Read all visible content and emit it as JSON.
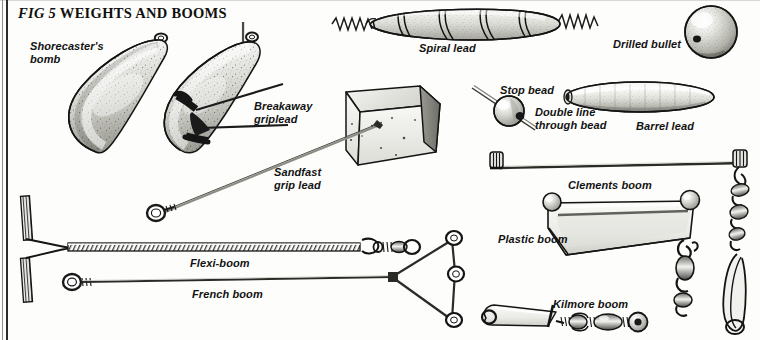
{
  "figure": {
    "title_prefix": "FIG 5",
    "title_main": "WEIGHTS AND BOOMS",
    "kind": "line-and-stipple technical illustration"
  },
  "colors": {
    "page_background": "#fdfdfb",
    "ink": "#121212",
    "rule_dark": "#2b2b2b",
    "rule_light": "#8d8d8d",
    "lead_body_light": "#f2f2ef",
    "lead_body_mid": "#c9c9c4",
    "lead_body_dark": "#8e8e88",
    "stipple": "#3a3a36",
    "wire": "#2a2a28",
    "plastic_fill": "#efefec"
  },
  "labels": [
    {
      "id": "shorecasters-bomb",
      "line1": "Shorecaster's",
      "line2": "bomb",
      "x": 30,
      "y": 40
    },
    {
      "id": "breakaway-griplead",
      "line1": "Breakaway",
      "line2": "griplead",
      "x": 254,
      "y": 100
    },
    {
      "id": "spiral-lead",
      "line1": "Spiral lead",
      "line2": "",
      "x": 419,
      "y": 42
    },
    {
      "id": "drilled-bullet",
      "line1": "Drilled bullet",
      "line2": "",
      "x": 613,
      "y": 38
    },
    {
      "id": "stop-bead",
      "line1": "Stop bead",
      "line2": "",
      "x": 500,
      "y": 84
    },
    {
      "id": "double-line-bead",
      "line1": "Double line",
      "line2": "through bead",
      "x": 535,
      "y": 106
    },
    {
      "id": "barrel-lead",
      "line1": "Barrel lead",
      "line2": "",
      "x": 636,
      "y": 120
    },
    {
      "id": "sandfast-grip-lead",
      "line1": "Sandfast",
      "line2": "grip lead",
      "x": 274,
      "y": 166
    },
    {
      "id": "clements-boom",
      "line1": "Clements boom",
      "line2": "",
      "x": 568,
      "y": 179
    },
    {
      "id": "plastic-boom",
      "line1": "Plastic boom",
      "line2": "",
      "x": 498,
      "y": 233
    },
    {
      "id": "flexi-boom",
      "line1": "Flexi-boom",
      "line2": "",
      "x": 190,
      "y": 257
    },
    {
      "id": "kilmore-boom",
      "line1": "Kilmore boom",
      "line2": "",
      "x": 553,
      "y": 298
    },
    {
      "id": "french-boom",
      "line1": "French boom",
      "line2": "",
      "x": 192,
      "y": 288
    }
  ],
  "items": [
    {
      "id": "shorecasters-bomb",
      "name": "Shorecaster's bomb",
      "type": "lead weight",
      "shape": "teardrop / pear, wire swivel eye at top"
    },
    {
      "id": "breakaway-griplead",
      "name": "Breakaway griplead",
      "type": "lead weight",
      "shape": "teardrop with sprung grip wires and release collar"
    },
    {
      "id": "spiral-lead",
      "name": "Spiral lead",
      "type": "lead weight",
      "shape": "spindle with spiral groove and coiled wire ends"
    },
    {
      "id": "drilled-bullet",
      "name": "Drilled bullet",
      "type": "lead weight",
      "shape": "sphere with through bore"
    },
    {
      "id": "barrel-lead",
      "name": "Barrel lead",
      "type": "lead weight",
      "shape": "elongated barrel with through bore"
    },
    {
      "id": "sandfast-grip-lead",
      "name": "Sandfast grip lead",
      "type": "lead weight",
      "shape": "triangular wedge block with wire loop trace"
    },
    {
      "id": "stop-bead",
      "name": "Stop bead",
      "type": "component",
      "shape": "round bead on line"
    },
    {
      "id": "double-line-bead",
      "name": "Double line through bead",
      "type": "rig detail",
      "shape": "two line strands passing through bead"
    },
    {
      "id": "clements-boom",
      "name": "Clements boom",
      "type": "boom",
      "shape": "straight wire boom, rolling sleeve each end"
    },
    {
      "id": "plastic-boom",
      "name": "Plastic boom",
      "type": "boom",
      "shape": "moulded triangular plastic boom with end beads"
    },
    {
      "id": "flexi-boom",
      "name": "Flexi-boom",
      "type": "boom",
      "shape": "coiled spring body, swivel and bead, wishbone tail"
    },
    {
      "id": "french-boom",
      "name": "French boom",
      "type": "boom",
      "shape": "long straight wire with eye and triangular frame"
    },
    {
      "id": "kilmore-boom",
      "name": "Kilmore boom",
      "type": "boom",
      "shape": "short flat boom with swivel, bead and link ring"
    }
  ]
}
